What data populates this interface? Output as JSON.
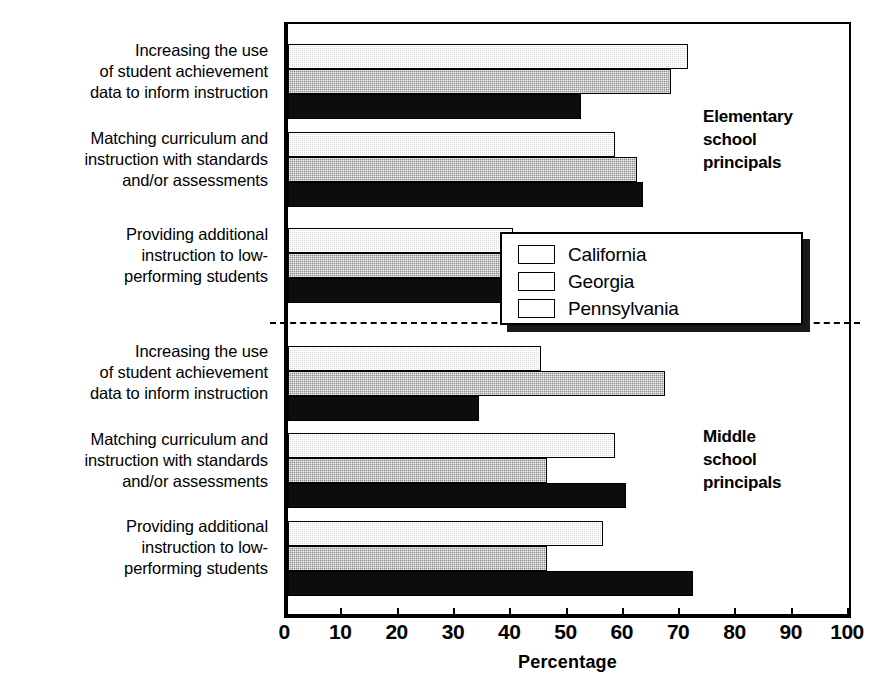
{
  "chart_data": {
    "type": "bar",
    "orientation": "horizontal",
    "title": "",
    "xlabel": "Percentage",
    "ylabel": "",
    "xlim": [
      0,
      100
    ],
    "xticks": [
      0,
      10,
      20,
      30,
      40,
      50,
      60,
      70,
      80,
      90,
      100
    ],
    "grid": false,
    "legend_position": "center-right",
    "categories": [
      "Increasing the use of student achievement data to inform instruction",
      "Matching curriculum and instruction with standards and/or assessments",
      "Providing additional instruction to low-performing students",
      "Increasing the use of student achievement data to inform instruction",
      "Matching curriculum and instruction with standards and/or assessments",
      "Providing additional instruction to low-performing students"
    ],
    "panels": [
      {
        "name": "Elementary school principals",
        "categories": [
          "Increasing the use of student achievement data to inform instruction",
          "Matching curriculum and instruction with standards and/or assessments",
          "Providing additional instruction to low-performing students"
        ],
        "series": [
          {
            "name": "California",
            "values": [
              71,
              58,
              40
            ]
          },
          {
            "name": "Georgia",
            "values": [
              68,
              62,
              38
            ]
          },
          {
            "name": "Pennsylvania",
            "values": [
              52,
              63,
              50
            ]
          }
        ]
      },
      {
        "name": "Middle school principals",
        "categories": [
          "Increasing the use of student achievement data to inform instruction",
          "Matching curriculum and instruction with standards and/or assessments",
          "Providing additional instruction to low-performing students"
        ],
        "series": [
          {
            "name": "California",
            "values": [
              45,
              58,
              56
            ]
          },
          {
            "name": "Georgia",
            "values": [
              67,
              46,
              46
            ]
          },
          {
            "name": "Pennsylvania",
            "values": [
              34,
              60,
              72
            ]
          }
        ]
      }
    ],
    "series": [
      {
        "name": "California",
        "values": [
          71,
          58,
          40,
          45,
          58,
          56
        ],
        "color": "#d9d9d9"
      },
      {
        "name": "Georgia",
        "values": [
          68,
          62,
          38,
          67,
          46,
          46
        ],
        "color": "#8a8a8a"
      },
      {
        "name": "Pennsylvania",
        "values": [
          52,
          63,
          50,
          34,
          60,
          72
        ],
        "color": "#0d0d0d"
      }
    ]
  },
  "axis": {
    "title": "Percentage",
    "ticks": [
      "0",
      "10",
      "20",
      "30",
      "40",
      "50",
      "60",
      "70",
      "80",
      "90",
      "100"
    ]
  },
  "categories": [
    {
      "line1": "Increasing the use",
      "line2": "of student achievement",
      "line3": "data to inform instruction"
    },
    {
      "line1": "Matching curriculum and",
      "line2": "instruction with standards",
      "line3": "and/or assessments"
    },
    {
      "line1": "Providing additional",
      "line2": "instruction to low-",
      "line3": "performing students"
    },
    {
      "line1": "Increasing the use",
      "line2": "of student achievement",
      "line3": "data to inform instruction"
    },
    {
      "line1": "Matching curriculum and",
      "line2": "instruction with standards",
      "line3": "and/or assessments"
    },
    {
      "line1": "Providing additional",
      "line2": "instruction to low-",
      "line3": "performing students"
    }
  ],
  "panel_notes": {
    "elementary": {
      "line1": "Elementary",
      "line2": "school",
      "line3": "principals"
    },
    "middle": {
      "line1": "Middle",
      "line2": "school",
      "line3": "principals"
    }
  },
  "legend": {
    "items": [
      {
        "label": "California",
        "swatch": "light-checker-swatch"
      },
      {
        "label": "Georgia",
        "swatch": "medium-checker-swatch"
      },
      {
        "label": "Pennsylvania",
        "swatch": "black-swatch"
      }
    ]
  }
}
